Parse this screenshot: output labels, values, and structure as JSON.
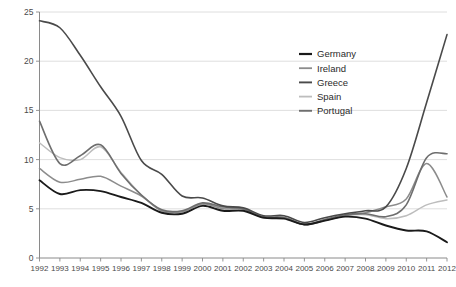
{
  "chart_data": {
    "type": "line",
    "title": "",
    "subtitle": "",
    "xlabel": "",
    "ylabel": "",
    "xlim": [
      1992,
      2012
    ],
    "ylim": [
      0,
      25
    ],
    "grid": true,
    "legend_position": "top-right",
    "yticks": [
      0,
      5,
      10,
      15,
      20,
      25
    ],
    "ytick_labels": [
      "0",
      "5",
      "10",
      "15",
      "20",
      "25"
    ],
    "x": [
      1992,
      1993,
      1994,
      1995,
      1996,
      1997,
      1998,
      1999,
      2000,
      2001,
      2002,
      2003,
      2004,
      2005,
      2006,
      2007,
      2008,
      2009,
      2010,
      2011,
      2012
    ],
    "xtick_labels": [
      "1992",
      "1993",
      "1994",
      "1995",
      "1996",
      "1997",
      "1998",
      "1999",
      "2000",
      "2001",
      "2002",
      "2003",
      "2004",
      "2005",
      "2006",
      "2007",
      "2008",
      "2009",
      "2010",
      "2011",
      "2012"
    ],
    "series": [
      {
        "name": "Germany",
        "color": "#1a1a1a",
        "width": 1.9,
        "values": [
          7.9,
          6.5,
          6.9,
          6.8,
          6.2,
          5.6,
          4.6,
          4.5,
          5.3,
          4.8,
          4.8,
          4.1,
          4.0,
          3.4,
          3.8,
          4.2,
          4.0,
          3.3,
          2.8,
          2.7,
          1.6
        ]
      },
      {
        "name": "Ireland",
        "color": "#8c8c8c",
        "width": 1.5,
        "values": [
          9.1,
          7.7,
          8.0,
          8.3,
          7.3,
          6.3,
          4.8,
          4.7,
          5.5,
          5.0,
          5.0,
          4.1,
          4.1,
          3.4,
          3.8,
          4.3,
          4.6,
          5.2,
          6.0,
          9.6,
          6.2
        ]
      },
      {
        "name": "Greece",
        "color": "#4a4a4a",
        "width": 1.6,
        "values": [
          24.1,
          23.4,
          20.6,
          17.4,
          14.4,
          9.9,
          8.5,
          6.3,
          6.1,
          5.3,
          5.1,
          4.3,
          4.3,
          3.6,
          4.1,
          4.5,
          4.8,
          5.2,
          9.1,
          15.8,
          22.7
        ]
      },
      {
        "name": "Spain",
        "color": "#bdbdbd",
        "width": 1.5,
        "values": [
          11.7,
          10.2,
          10.0,
          11.3,
          8.7,
          6.4,
          4.8,
          4.7,
          5.5,
          5.1,
          5.0,
          4.1,
          4.1,
          3.4,
          3.8,
          4.3,
          4.4,
          4.0,
          4.3,
          5.4,
          5.9
        ]
      },
      {
        "name": "Portugal",
        "color": "#6e6e6e",
        "width": 1.6,
        "values": [
          13.9,
          9.6,
          10.4,
          11.5,
          8.6,
          6.4,
          4.9,
          4.8,
          5.6,
          5.2,
          5.0,
          4.2,
          4.1,
          3.4,
          3.9,
          4.4,
          4.5,
          4.2,
          5.4,
          10.2,
          10.6
        ]
      }
    ]
  },
  "legend": {
    "entries": [
      {
        "label": "Germany"
      },
      {
        "label": "Ireland"
      },
      {
        "label": "Greece"
      },
      {
        "label": "Spain"
      },
      {
        "label": "Portugal"
      }
    ]
  }
}
